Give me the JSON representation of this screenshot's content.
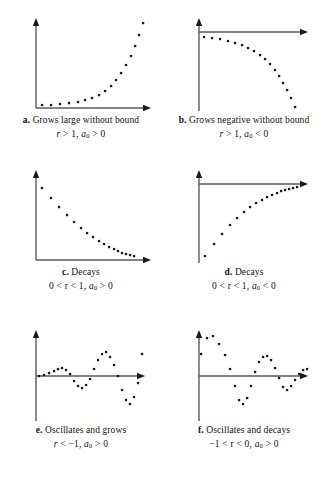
{
  "figure": {
    "title": "",
    "panel_width": 162,
    "panel_height": 159,
    "dot_color": "#1a1a1a",
    "axis_color": "#5a5a5a"
  },
  "panels": [
    {
      "id": "a",
      "label": "a.",
      "caption": "Grows large without bound",
      "formula_parts": {
        "left": "r",
        "mid": " > 1,  ",
        "a": "a",
        "sub": "0",
        "right": " > 0"
      },
      "formula_text": "r > 1, a0 > 0"
    },
    {
      "id": "b",
      "label": "b.",
      "caption": "Grows negative without bound",
      "formula_parts": {
        "left": "r",
        "mid": " > 1,  ",
        "a": "a",
        "sub": "0",
        "right": " < 0"
      },
      "formula_text": "r > 1, a0 < 0"
    },
    {
      "id": "c",
      "label": "c.",
      "caption": "Decays",
      "formula_parts": {
        "left": "0 < r",
        "mid": " < 1,  ",
        "a": "a",
        "sub": "0",
        "right": " > 0"
      },
      "formula_text": "0 < r < 1, a0 > 0"
    },
    {
      "id": "d",
      "label": "d.",
      "caption": "Decays",
      "formula_parts": {
        "left": "0 < r",
        "mid": " < 1,  ",
        "a": "a",
        "sub": "0",
        "right": " < 0"
      },
      "formula_text": "0 < r < 1, a0 < 0"
    },
    {
      "id": "e",
      "label": "e.",
      "caption": "Oscillates and grows",
      "formula_parts": {
        "left": "r",
        "mid": " < −1,  ",
        "a": "a",
        "sub": "0",
        "right": " > 0"
      },
      "formula_text": "r < -1, a0 > 0"
    },
    {
      "id": "f",
      "label": "f.",
      "caption": "Oscillates and decays",
      "formula_parts": {
        "left": "−1 < r",
        "mid": " < 0,  ",
        "a": "a",
        "sub": "0",
        "right": " > 0"
      },
      "formula_text": "-1 < r < 0, a0 > 0"
    }
  ],
  "chart_data": [
    {
      "type": "scatter",
      "id": "a",
      "title": "Grows large without bound",
      "annotation": "r > 1, a0 > 0",
      "xlabel": "n",
      "ylabel": "a_n",
      "grid": false,
      "legend": "none",
      "axis_origin": [
        22,
        94
      ],
      "xlim": [
        0,
        140
      ],
      "ylim": [
        0,
        100
      ],
      "x": [
        28,
        37,
        46,
        55,
        64,
        71,
        78,
        85,
        91,
        97,
        102,
        107,
        112,
        117,
        121,
        125,
        129
      ],
      "y": [
        91,
        91,
        90,
        89,
        88,
        86,
        84,
        81,
        77,
        72,
        66,
        59,
        51,
        42,
        32,
        21,
        9
      ]
    },
    {
      "type": "scatter",
      "id": "b",
      "title": "Grows negative without bound",
      "annotation": "r > 1, a0 < 0",
      "xlabel": "n",
      "ylabel": "a_n",
      "grid": false,
      "legend": "none",
      "axis_origin": [
        22,
        18
      ],
      "xlim": [
        0,
        140
      ],
      "ylim": [
        0,
        100
      ],
      "x": [
        27,
        35,
        43,
        51,
        58,
        65,
        71,
        77,
        83,
        88,
        93,
        98,
        102,
        106,
        110,
        114,
        118
      ],
      "y": [
        23,
        24,
        25,
        27,
        29,
        31,
        34,
        37,
        41,
        45,
        50,
        56,
        62,
        69,
        76,
        84,
        93
      ]
    },
    {
      "type": "scatter",
      "id": "c",
      "title": "Decays",
      "annotation": "0 < r < 1, a0 > 0",
      "xlabel": "n",
      "ylabel": "a_n",
      "grid": false,
      "legend": "none",
      "axis_origin": [
        22,
        94
      ],
      "xlim": [
        0,
        140
      ],
      "ylim": [
        0,
        100
      ],
      "x": [
        28,
        37,
        45,
        53,
        60,
        67,
        73,
        79,
        85,
        90,
        95,
        100,
        104,
        108,
        112,
        116,
        120
      ],
      "y": [
        22,
        32,
        41,
        49,
        56,
        62,
        67,
        71,
        75,
        78,
        81,
        83,
        85,
        87,
        88,
        89,
        90
      ]
    },
    {
      "type": "scatter",
      "id": "d",
      "title": "Decays",
      "annotation": "0 < r < 1, a0 < 0",
      "xlabel": "n",
      "ylabel": "a_n",
      "grid": false,
      "legend": "none",
      "axis_origin": [
        22,
        18
      ],
      "xlim": [
        0,
        140
      ],
      "ylim": [
        0,
        100
      ],
      "x": [
        28,
        37,
        45,
        53,
        60,
        67,
        73,
        79,
        85,
        90,
        95,
        100,
        104,
        108,
        112,
        116,
        120
      ],
      "y": [
        90,
        78,
        68,
        59,
        52,
        46,
        41,
        37,
        34,
        31,
        29,
        27,
        25,
        24,
        23,
        22,
        21
      ]
    },
    {
      "type": "scatter",
      "id": "e",
      "title": "Oscillates and grows",
      "annotation": "r < -1, a0 > 0",
      "xlabel": "n",
      "ylabel": "a_n",
      "grid": false,
      "legend": "none",
      "axis_origin": [
        22,
        52
      ],
      "xlim": [
        0,
        140
      ],
      "ylim": [
        0,
        100
      ],
      "x": [
        25,
        30,
        35,
        40,
        44,
        48,
        52,
        56,
        60,
        64,
        68,
        72,
        76,
        80,
        84,
        88,
        92,
        96,
        100,
        104,
        108,
        112,
        116,
        120,
        124,
        128
      ],
      "y": [
        52,
        51,
        49,
        47,
        45,
        44,
        46,
        50,
        57,
        62,
        64,
        61,
        55,
        45,
        36,
        30,
        28,
        33,
        41,
        52,
        66,
        76,
        80,
        73,
        59,
        30
      ]
    },
    {
      "type": "scatter",
      "id": "f",
      "title": "Oscillates and decays",
      "annotation": "-1 < r < 0, a0 > 0",
      "xlabel": "n",
      "ylabel": "a_n",
      "grid": false,
      "legend": "none",
      "axis_origin": [
        22,
        52
      ],
      "xlim": [
        0,
        140
      ],
      "ylim": [
        0,
        100
      ],
      "x": [
        24,
        30,
        36,
        42,
        48,
        53,
        58,
        62,
        66,
        70,
        74,
        78,
        82,
        86,
        90,
        94,
        98,
        102,
        106,
        110,
        114,
        118,
        122,
        126,
        130
      ],
      "y": [
        30,
        14,
        12,
        20,
        31,
        45,
        62,
        76,
        80,
        74,
        62,
        48,
        38,
        33,
        32,
        36,
        44,
        54,
        63,
        66,
        62,
        56,
        50,
        46,
        45
      ]
    }
  ]
}
